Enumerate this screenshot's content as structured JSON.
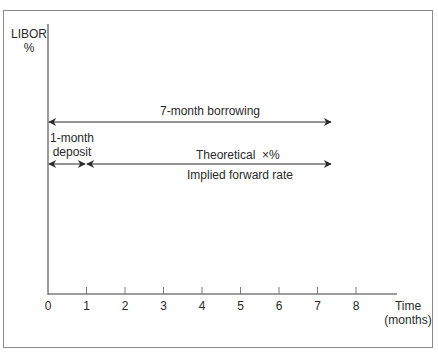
{
  "diagram": {
    "y_axis_label_line1": "LIBOR",
    "y_axis_label_line2": "%",
    "x_axis_label_line1": "Time",
    "x_axis_label_line2": "(months)",
    "x_ticks": [
      "0",
      "1",
      "2",
      "3",
      "4",
      "5",
      "6",
      "7",
      "8"
    ],
    "arrows": {
      "borrowing": "7-month borrowing",
      "deposit_line1": "1-month",
      "deposit_line2": "deposit",
      "forward_top": "Theoretical  ×%",
      "forward_bottom": "Implied forward rate"
    }
  }
}
